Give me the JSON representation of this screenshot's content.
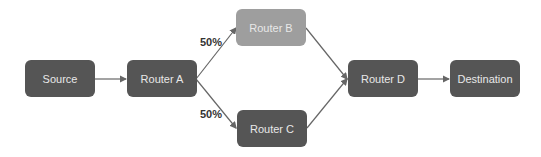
{
  "diagram": {
    "nodes": [
      {
        "id": "source",
        "label": "Source",
        "style": "dark"
      },
      {
        "id": "router_a",
        "label": "Router A",
        "style": "dark"
      },
      {
        "id": "router_b",
        "label": "Router B",
        "style": "light"
      },
      {
        "id": "router_c",
        "label": "Router C",
        "style": "dark"
      },
      {
        "id": "router_d",
        "label": "Router D",
        "style": "dark"
      },
      {
        "id": "destination",
        "label": "Destination",
        "style": "dark"
      }
    ],
    "edges": [
      {
        "from": "source",
        "to": "router_a"
      },
      {
        "from": "router_a",
        "to": "router_b",
        "label": "50%"
      },
      {
        "from": "router_a",
        "to": "router_c",
        "label": "50%"
      },
      {
        "from": "router_b",
        "to": "router_d"
      },
      {
        "from": "router_c",
        "to": "router_d"
      },
      {
        "from": "router_d",
        "to": "destination"
      }
    ],
    "colors": {
      "dark_node": "#555555",
      "light_node": "#9e9e9e",
      "edge": "#666666"
    }
  }
}
